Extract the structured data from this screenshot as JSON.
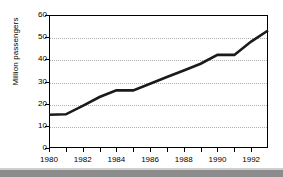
{
  "chart_data": {
    "type": "line",
    "title": "",
    "subtitle": "",
    "xlabel": "",
    "ylabel": "Million passengers",
    "xlim": [
      1980,
      1993
    ],
    "ylim": [
      0,
      60
    ],
    "grid": "horizontal-dotted",
    "legend": "none",
    "x": [
      1980,
      1981,
      1982,
      1983,
      1984,
      1985,
      1986,
      1987,
      1988,
      1989,
      1990,
      1991,
      1992,
      1993
    ],
    "values": [
      15,
      15.2,
      19,
      23,
      26,
      26,
      29,
      32,
      35,
      38,
      42,
      42,
      48,
      53
    ],
    "series": [
      {
        "name": "Million passengers",
        "values": [
          15,
          15.2,
          19,
          23,
          26,
          26,
          29,
          32,
          35,
          38,
          42,
          42,
          48,
          53
        ],
        "color": "#1a1a1a"
      }
    ],
    "y_ticks": [
      0,
      10,
      20,
      30,
      40,
      50,
      60
    ],
    "y_tick_labels": [
      "0",
      "10",
      "20",
      "30",
      "40",
      "50",
      "60"
    ],
    "x_ticks": [
      1980,
      1981,
      1982,
      1983,
      1984,
      1985,
      1986,
      1987,
      1988,
      1989,
      1990,
      1991,
      1992,
      1993
    ],
    "x_tick_labels": [
      "1980",
      "",
      "1982",
      "",
      "1984",
      "",
      "1986",
      "",
      "1988",
      "",
      "1990",
      "",
      "1992",
      ""
    ],
    "x_labeled_ticks": [
      {
        "value": 1980,
        "label": "1980"
      },
      {
        "value": 1982,
        "label": "1982"
      },
      {
        "value": 1984,
        "label": "1984"
      },
      {
        "value": 1986,
        "label": "1986"
      },
      {
        "value": 1988,
        "label": "1988"
      },
      {
        "value": 1990,
        "label": "1990"
      },
      {
        "value": 1992,
        "label": "1992"
      }
    ],
    "colors": {
      "line": "#1a1a1a",
      "axis": "#000000",
      "grid": "#b0b0b0",
      "background": "#ffffff"
    }
  }
}
